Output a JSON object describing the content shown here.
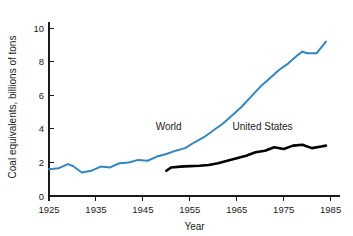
{
  "chart_data": {
    "type": "line",
    "title": "",
    "subtitle": "",
    "xlabel": "Year",
    "ylabel": "Coal equivalents, billions of tons",
    "xlim": [
      1925,
      1987
    ],
    "ylim": [
      0,
      10.6
    ],
    "xticks": [
      1925,
      1935,
      1945,
      1955,
      1965,
      1975,
      1985
    ],
    "xtick_labels": [
      "1925",
      "1935",
      "1945",
      "1955",
      "1965",
      "1975",
      "1985"
    ],
    "yticks": [
      0,
      2,
      4,
      6,
      8,
      10
    ],
    "ytick_labels": [
      "0",
      "2",
      "4",
      "6",
      "8",
      "10"
    ],
    "grid": false,
    "legend_position": "inline-annotation",
    "series": [
      {
        "name": "World",
        "color": "#2E86C8",
        "line_width": 2.0,
        "label_x": 1950.5,
        "label_y": 3.95,
        "x": [
          1925,
          1927,
          1929,
          1930,
          1932,
          1934,
          1936,
          1938,
          1940,
          1942,
          1944,
          1946,
          1948,
          1950,
          1952,
          1954,
          1956,
          1958,
          1960,
          1962,
          1964,
          1966,
          1968,
          1970,
          1972,
          1974,
          1976,
          1978,
          1979,
          1980,
          1981,
          1982,
          1984
        ],
        "y": [
          1.6,
          1.65,
          1.9,
          1.8,
          1.4,
          1.5,
          1.75,
          1.7,
          1.95,
          2.0,
          2.15,
          2.1,
          2.35,
          2.5,
          2.7,
          2.85,
          3.2,
          3.5,
          3.9,
          4.3,
          4.8,
          5.3,
          5.9,
          6.5,
          7.0,
          7.5,
          7.9,
          8.4,
          8.6,
          8.5,
          8.5,
          8.5,
          9.2
        ]
      },
      {
        "name": "United States",
        "color": "#000000",
        "line_width": 2.6,
        "label_x": 1970.5,
        "label_y": 3.95,
        "x": [
          1950,
          1951,
          1953,
          1955,
          1957,
          1959,
          1961,
          1963,
          1965,
          1967,
          1969,
          1971,
          1973,
          1975,
          1977,
          1979,
          1981,
          1983,
          1984
        ],
        "y": [
          1.5,
          1.7,
          1.75,
          1.78,
          1.8,
          1.85,
          1.95,
          2.1,
          2.25,
          2.4,
          2.6,
          2.7,
          2.9,
          2.8,
          3.0,
          3.05,
          2.85,
          2.95,
          3.0
        ]
      }
    ]
  },
  "figure": {
    "background_color": "#ffffff",
    "axis_color": "#1a1a1a"
  }
}
